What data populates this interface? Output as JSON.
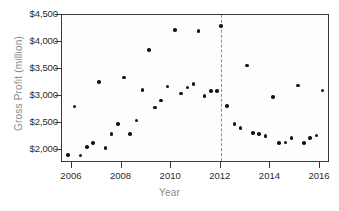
{
  "chart_data": {
    "type": "scatter",
    "title": "",
    "xlabel": "Year",
    "ylabel": "Gross Profit (million)",
    "xlim": [
      2005.6,
      2016.4
    ],
    "ylim": [
      1750,
      4500
    ],
    "grid": false,
    "legend": "none",
    "x_ticks": [
      2006,
      2008,
      2010,
      2012,
      2014,
      2016
    ],
    "x_tick_labels": [
      "2006",
      "2008",
      "2010",
      "2012",
      "2014",
      "2016"
    ],
    "y_ticks": [
      2000,
      2500,
      3000,
      3500,
      4000,
      4500
    ],
    "y_tick_labels": [
      "$2,000",
      "$2,500",
      "$3,000",
      "$3,500",
      "$4,000",
      "$4,500"
    ],
    "annotations": [
      {
        "type": "vertical-dashed-line",
        "x": 2012,
        "color": "#8e8e8e",
        "label": ""
      }
    ],
    "marker": {
      "shape": "circle",
      "color": "#141414",
      "size": 3.6
    },
    "points": [
      {
        "x": 2005.85,
        "y": 1900
      },
      {
        "x": 2006.1,
        "y": 2800
      },
      {
        "x": 2006.35,
        "y": 1890
      },
      {
        "x": 2006.6,
        "y": 2050
      },
      {
        "x": 2006.85,
        "y": 2120
      },
      {
        "x": 2007.1,
        "y": 3250
      },
      {
        "x": 2007.35,
        "y": 2030
      },
      {
        "x": 2007.6,
        "y": 2290
      },
      {
        "x": 2007.85,
        "y": 2480
      },
      {
        "x": 2008.1,
        "y": 3340
      },
      {
        "x": 2008.35,
        "y": 2290
      },
      {
        "x": 2008.6,
        "y": 2540
      },
      {
        "x": 2008.85,
        "y": 3110
      },
      {
        "x": 2009.1,
        "y": 3850
      },
      {
        "x": 2009.35,
        "y": 2780
      },
      {
        "x": 2009.6,
        "y": 2910
      },
      {
        "x": 2009.85,
        "y": 3170
      },
      {
        "x": 2010.15,
        "y": 4220
      },
      {
        "x": 2010.4,
        "y": 3040
      },
      {
        "x": 2010.65,
        "y": 3150
      },
      {
        "x": 2010.9,
        "y": 3220
      },
      {
        "x": 2011.1,
        "y": 4200
      },
      {
        "x": 2011.35,
        "y": 3000
      },
      {
        "x": 2011.6,
        "y": 3090
      },
      {
        "x": 2011.85,
        "y": 3090
      },
      {
        "x": 2012.0,
        "y": 4300
      },
      {
        "x": 2012.25,
        "y": 2810
      },
      {
        "x": 2012.55,
        "y": 2480
      },
      {
        "x": 2012.8,
        "y": 2400
      },
      {
        "x": 2013.05,
        "y": 3560
      },
      {
        "x": 2013.3,
        "y": 2310
      },
      {
        "x": 2013.55,
        "y": 2290
      },
      {
        "x": 2013.8,
        "y": 2250
      },
      {
        "x": 2014.1,
        "y": 2980
      },
      {
        "x": 2014.35,
        "y": 2120
      },
      {
        "x": 2014.6,
        "y": 2130
      },
      {
        "x": 2014.85,
        "y": 2220
      },
      {
        "x": 2015.1,
        "y": 3190
      },
      {
        "x": 2015.35,
        "y": 2120
      },
      {
        "x": 2015.6,
        "y": 2210
      },
      {
        "x": 2015.85,
        "y": 2260
      },
      {
        "x": 2016.1,
        "y": 3100
      }
    ]
  },
  "colors": {
    "marker": "#141414",
    "reference_line": "#8e8e8e",
    "axis": "#3a3a3a",
    "tick_text": "#2b2b2b",
    "axis_title": "#8a8a8a",
    "plot_background": "#fdfdfd"
  }
}
